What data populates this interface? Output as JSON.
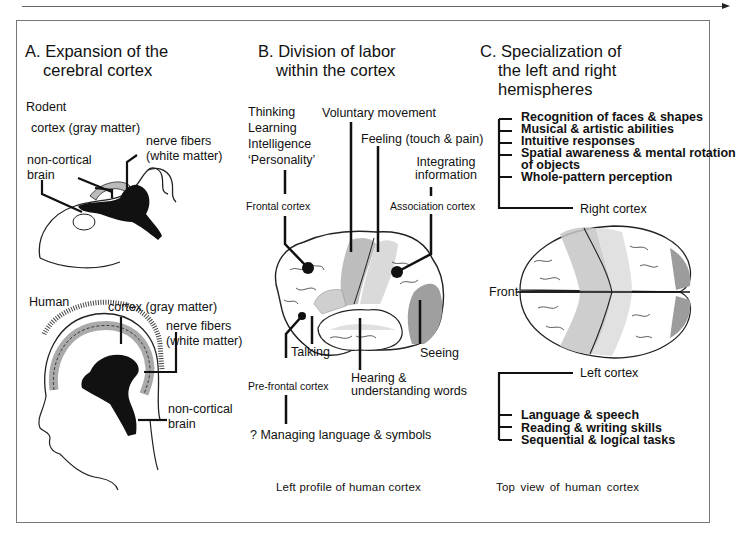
{
  "panels": {
    "a": {
      "heading_line1": "A.  Expansion of the",
      "heading_line2": "cerebral cortex",
      "rodent": {
        "title": "Rodent",
        "cortex_label": "cortex (gray matter)",
        "fibers_label_line1": "nerve fibers",
        "fibers_label_line2": "(white matter)",
        "noncortical_line1": "non-cortical",
        "noncortical_line2": "brain"
      },
      "human": {
        "title": "Human",
        "cortex_label": "cortex (gray matter)",
        "fibers_label_line1": "nerve fibers",
        "fibers_label_line2": "(white matter)",
        "noncortical_line1": "non-cortical",
        "noncortical_line2": "brain"
      }
    },
    "b": {
      "heading_line1": "B.  Division of labor",
      "heading_line2": "within the cortex",
      "frontal_functions": [
        "Thinking",
        "Learning",
        "Intelligence",
        "‘Personality’"
      ],
      "frontal_label": "Frontal cortex",
      "voluntary_movement": "Voluntary movement",
      "feeling": "Feeling (touch & pain)",
      "integrating_line1": "Integrating",
      "integrating_line2": "information",
      "association_label": "Association cortex",
      "talking": "Talking",
      "seeing": "Seeing",
      "prefrontal_label": "Pre-frontal cortex",
      "hearing_line1": "Hearing &",
      "hearing_line2": "understanding words",
      "managing": "? Managing language & symbols",
      "caption": "Left profile of human cortex"
    },
    "c": {
      "heading_line1": "C.  Specialization of",
      "heading_line2": "the left and right",
      "heading_line3": "hemispheres",
      "right_functions": [
        "Recognition of faces & shapes",
        "Musical & artistic abilities",
        "Intuitive responses",
        "Spatial awareness & mental rotation",
        "of objects",
        "Whole-pattern perception"
      ],
      "right_label": "Right cortex",
      "front_label": "Front",
      "left_label": "Left cortex",
      "left_functions": [
        "Language & speech",
        "Reading & writing skills",
        "Sequential & logical tasks"
      ],
      "caption": "Top view of  human  cortex"
    }
  },
  "colors": {
    "ink": "#111111",
    "gray_matter": "#b9b9b9",
    "light_region": "#d6d6d6",
    "dark_region": "#9a9a9a",
    "frame": "#777777"
  }
}
